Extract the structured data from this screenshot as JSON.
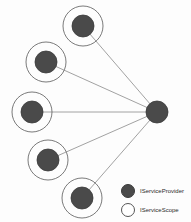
{
  "diagram": {
    "background_color": "#fdfdfd",
    "node_fill_color": "#4a4a4a",
    "node_stroke_color": "#3a3a3a",
    "scope_ring_color": "#6b6b6b",
    "edge_color": "#8a8a8a",
    "hub": {
      "id": "root-provider",
      "type": "IServiceProvider",
      "cx": 157,
      "cy": 112,
      "r": 11,
      "has_scope_ring": false
    },
    "nodes": [
      {
        "id": "scoped-provider-1",
        "type": "IServiceProvider",
        "cx": 83,
        "cy": 26,
        "r": 11,
        "ring_r": 20,
        "has_scope_ring": true
      },
      {
        "id": "scoped-provider-2",
        "type": "IServiceProvider",
        "cx": 46,
        "cy": 62,
        "r": 11,
        "ring_r": 20,
        "has_scope_ring": true
      },
      {
        "id": "scoped-provider-3",
        "type": "IServiceProvider",
        "cx": 32,
        "cy": 112,
        "r": 11,
        "ring_r": 20,
        "has_scope_ring": true
      },
      {
        "id": "scoped-provider-4",
        "type": "IServiceProvider",
        "cx": 48,
        "cy": 160,
        "r": 11,
        "ring_r": 20,
        "has_scope_ring": true
      },
      {
        "id": "scoped-provider-5",
        "type": "IServiceProvider",
        "cx": 82,
        "cy": 198,
        "r": 11,
        "ring_r": 20,
        "has_scope_ring": true
      }
    ],
    "edges": [
      {
        "from": "root-provider",
        "to": "scoped-provider-1"
      },
      {
        "from": "root-provider",
        "to": "scoped-provider-2"
      },
      {
        "from": "root-provider",
        "to": "scoped-provider-3"
      },
      {
        "from": "root-provider",
        "to": "scoped-provider-4"
      },
      {
        "from": "root-provider",
        "to": "scoped-provider-5"
      }
    ]
  },
  "legend": {
    "items": [
      {
        "marker": "filled-circle-icon",
        "style": "filled",
        "label": "IServiceProvider",
        "color": "#4a4a4a"
      },
      {
        "marker": "hollow-circle-icon",
        "style": "hollow",
        "label": "IServiceScope",
        "color": "#ffffff"
      }
    ]
  }
}
